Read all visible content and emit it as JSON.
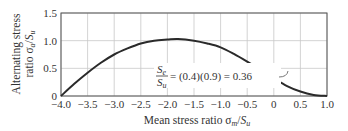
{
  "chart_data": {
    "type": "line",
    "title": "",
    "xlabel": "Mean stress ratio σm/Su",
    "ylabel": "Alternating stress ratio σa/Su",
    "ylabel_lines": [
      "Alternating stress",
      "ratio σa/Su"
    ],
    "xlim": [
      -4.0,
      1.0
    ],
    "ylim": [
      0,
      1.5
    ],
    "grid": true,
    "legend": null,
    "x_ticks": [
      "-4.0",
      "-3.5",
      "-3.0",
      "-2.5",
      "-2.0",
      "-1.5",
      "-1.0",
      "-0.5",
      "0",
      "0.5",
      "1.0"
    ],
    "x_tick_values": [
      -4.0,
      -3.5,
      -3.0,
      -2.5,
      -2.0,
      -1.5,
      -1.0,
      -0.5,
      0,
      0.5,
      1.0
    ],
    "y_ticks": [
      "0",
      "0.5",
      "1.0",
      "1.5"
    ],
    "y_tick_values": [
      0,
      0.5,
      1.0,
      1.5
    ],
    "series": [
      {
        "name": "Alternating stress ratio",
        "x": [
          -4.0,
          -3.75,
          -3.5,
          -3.25,
          -3.0,
          -2.75,
          -2.5,
          -2.25,
          -2.0,
          -1.8,
          -1.5,
          -1.25,
          -1.0,
          -0.75,
          -0.5,
          -0.25,
          0.0,
          0.25,
          0.5,
          0.75,
          1.0
        ],
        "y": [
          0.0,
          0.22,
          0.42,
          0.6,
          0.75,
          0.86,
          0.95,
          1.0,
          1.02,
          1.03,
          1.0,
          0.95,
          0.88,
          0.76,
          0.62,
          0.47,
          0.32,
          0.18,
          0.08,
          0.02,
          0.0
        ]
      }
    ],
    "annotations": [
      {
        "text": "Se/Su = (0.4)(0.9) = 0.36",
        "fraction_numerator": "Se",
        "fraction_denominator": "Su",
        "expression": "= (0.4)(0.9) = 0.36",
        "points_to": {
          "x": -0.3,
          "y": 0.5
        }
      }
    ]
  }
}
